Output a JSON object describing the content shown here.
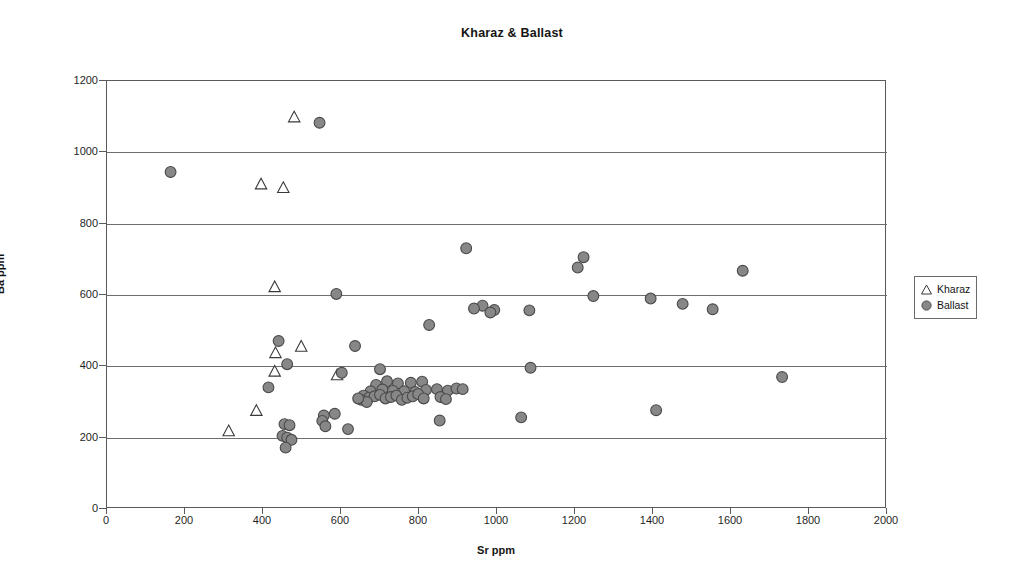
{
  "chart_data": {
    "type": "scatter",
    "title": "Kharaz & Ballast",
    "xlabel": "Sr ppm",
    "ylabel": "Ba ppm",
    "xlim": [
      0,
      2000
    ],
    "ylim": [
      0,
      1200
    ],
    "xticks": [
      0,
      200,
      400,
      600,
      800,
      1000,
      1200,
      1400,
      1600,
      1800,
      2000
    ],
    "yticks": [
      0,
      200,
      400,
      600,
      800,
      1000,
      1200
    ],
    "grid": "horizontal",
    "legend_position": "right-outside",
    "series": [
      {
        "name": "Kharaz",
        "marker": "triangle-open",
        "color": "#ffffff",
        "edge_color": "#3a3a3a",
        "points": [
          [
            480,
            1098
          ],
          [
            395,
            910
          ],
          [
            452,
            900
          ],
          [
            430,
            622
          ],
          [
            498,
            455
          ],
          [
            432,
            437
          ],
          [
            430,
            385
          ],
          [
            590,
            375
          ],
          [
            383,
            275
          ],
          [
            312,
            218
          ]
        ]
      },
      {
        "name": "Ballast",
        "marker": "circle-filled",
        "color": "#878787",
        "edge_color": "#4a4a4a",
        "points": [
          [
            545,
            1083
          ],
          [
            163,
            945
          ],
          [
            921,
            731
          ],
          [
            1222,
            706
          ],
          [
            1207,
            677
          ],
          [
            1630,
            668
          ],
          [
            1247,
            597
          ],
          [
            1394,
            590
          ],
          [
            1476,
            575
          ],
          [
            963,
            570
          ],
          [
            993,
            558
          ],
          [
            1083,
            557
          ],
          [
            1553,
            560
          ],
          [
            941,
            562
          ],
          [
            983,
            551
          ],
          [
            588,
            603
          ],
          [
            826,
            516
          ],
          [
            636,
            457
          ],
          [
            440,
            471
          ],
          [
            462,
            406
          ],
          [
            602,
            382
          ],
          [
            700,
            392
          ],
          [
            1086,
            396
          ],
          [
            1731,
            370
          ],
          [
            414,
            341
          ],
          [
            718,
            358
          ],
          [
            746,
            352
          ],
          [
            779,
            354
          ],
          [
            808,
            357
          ],
          [
            690,
            348
          ],
          [
            676,
            330
          ],
          [
            706,
            335
          ],
          [
            733,
            331
          ],
          [
            762,
            330
          ],
          [
            790,
            328
          ],
          [
            818,
            334
          ],
          [
            846,
            336
          ],
          [
            874,
            332
          ],
          [
            896,
            338
          ],
          [
            912,
            336
          ],
          [
            658,
            318
          ],
          [
            672,
            312
          ],
          [
            686,
            316
          ],
          [
            700,
            320
          ],
          [
            714,
            310
          ],
          [
            728,
            314
          ],
          [
            742,
            318
          ],
          [
            756,
            306
          ],
          [
            770,
            312
          ],
          [
            784,
            316
          ],
          [
            798,
            322
          ],
          [
            812,
            310
          ],
          [
            855,
            314
          ],
          [
            869,
            308
          ],
          [
            652,
            306
          ],
          [
            666,
            300
          ],
          [
            644,
            310
          ],
          [
            556,
            262
          ],
          [
            584,
            267
          ],
          [
            552,
            247
          ],
          [
            560,
            232
          ],
          [
            618,
            224
          ],
          [
            853,
            248
          ],
          [
            1062,
            257
          ],
          [
            1408,
            277
          ],
          [
            455,
            238
          ],
          [
            468,
            235
          ],
          [
            450,
            205
          ],
          [
            462,
            200
          ],
          [
            473,
            194
          ],
          [
            458,
            172
          ]
        ]
      }
    ]
  },
  "legend": {
    "items": [
      {
        "label": "Kharaz",
        "marker": "triangle-open"
      },
      {
        "label": "Ballast",
        "marker": "circle-filled"
      }
    ]
  }
}
